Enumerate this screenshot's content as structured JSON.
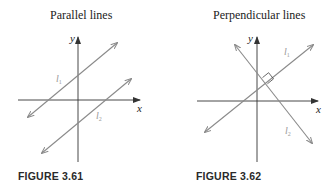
{
  "figures": [
    {
      "title": "Parallel lines",
      "caption": "FIGURE 3.61",
      "axis_labels": {
        "x": "x",
        "y": "y"
      },
      "lines": [
        {
          "label": "l",
          "subscript": "1"
        },
        {
          "label": "l",
          "subscript": "2"
        }
      ]
    },
    {
      "title": "Perpendicular lines",
      "caption": "FIGURE 3.62",
      "axis_labels": {
        "x": "x",
        "y": "y"
      },
      "lines": [
        {
          "label": "l",
          "subscript": "1"
        },
        {
          "label": "l",
          "subscript": "2"
        }
      ]
    }
  ],
  "colors": {
    "axis": "#333333",
    "line": "#8a8a8a",
    "text": "#222222"
  }
}
